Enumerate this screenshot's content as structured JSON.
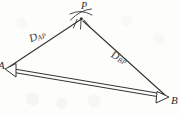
{
  "figure": {
    "type": "geometry-diagram",
    "background_color": "#fdfdfc",
    "stroke_color": "#333333",
    "label_color": "#2b2b2b"
  },
  "points": {
    "A": {
      "label": "A",
      "x": 5,
      "y": 69,
      "marker": "open-arrowhead",
      "arrow_direction": "left"
    },
    "B": {
      "label": "B",
      "x": 168,
      "y": 97,
      "marker": "open-arrowhead",
      "arrow_direction": "right"
    },
    "P": {
      "label": "P",
      "x": 81,
      "y": 18,
      "marker": "intersecting-arcs"
    }
  },
  "segments": [
    {
      "name": "segment-AP",
      "from": "A",
      "to": "P",
      "style": "single-line",
      "label": "D",
      "label_subscript": "AP"
    },
    {
      "name": "segment-BP",
      "from": "B",
      "to": "P",
      "style": "single-line",
      "label": "D",
      "label_subscript": "BP"
    },
    {
      "name": "segment-AB-baseline",
      "from": "A",
      "to": "B",
      "style": "double-line",
      "label": "",
      "label_subscript": ""
    }
  ],
  "labels": {
    "vertex_a": "A",
    "vertex_b": "B",
    "vertex_p": "P",
    "distance_ap_base": "D",
    "distance_ap_sub": "AP",
    "distance_bp_base": "D",
    "distance_bp_sub": "BP"
  }
}
